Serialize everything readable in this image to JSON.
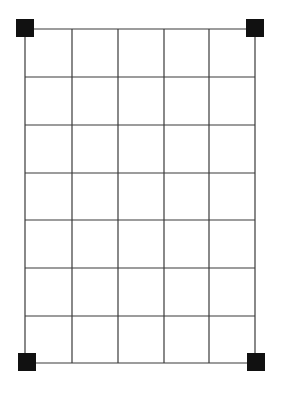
{
  "diagram": {
    "type": "grid-with-corner-markers",
    "colors": {
      "background": "#ffffff",
      "grid_line": "#3a3a3a",
      "marker": "#111111"
    },
    "grid": {
      "columns": 5,
      "rows": 7,
      "x_lines": [
        25,
        72,
        118,
        164,
        209,
        255
      ],
      "y_lines": [
        29,
        77,
        125,
        173,
        220,
        268,
        316,
        363
      ],
      "line_width": 1.2
    },
    "markers": [
      {
        "name": "top-left",
        "cx": 25,
        "cy": 28,
        "size": 18
      },
      {
        "name": "top-right",
        "cx": 255,
        "cy": 28,
        "size": 18
      },
      {
        "name": "bottom-left",
        "cx": 27,
        "cy": 362,
        "size": 18
      },
      {
        "name": "bottom-right",
        "cx": 256,
        "cy": 362,
        "size": 18
      }
    ]
  }
}
